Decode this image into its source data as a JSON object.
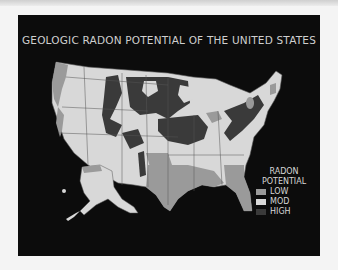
{
  "title": "GEOLOGIC RADON POTENTIAL OF THE UNITED STATES",
  "legend": {
    "heading_line1": "RADON",
    "heading_line2": "POTENTIAL",
    "items": [
      {
        "label": "LOW",
        "color": "#9a9a9a"
      },
      {
        "label": "MOD",
        "color": "#d8d8d8"
      },
      {
        "label": "HIGH",
        "color": "#3a3a3a"
      }
    ]
  },
  "colors": {
    "background": "#0c0c0c",
    "low": "#9a9a9a",
    "moderate": "#d8d8d8",
    "high": "#3a3a3a",
    "state_border": "#555555"
  },
  "regions_shown": [
    "Contiguous United States",
    "Alaska",
    "Hawaii"
  ]
}
